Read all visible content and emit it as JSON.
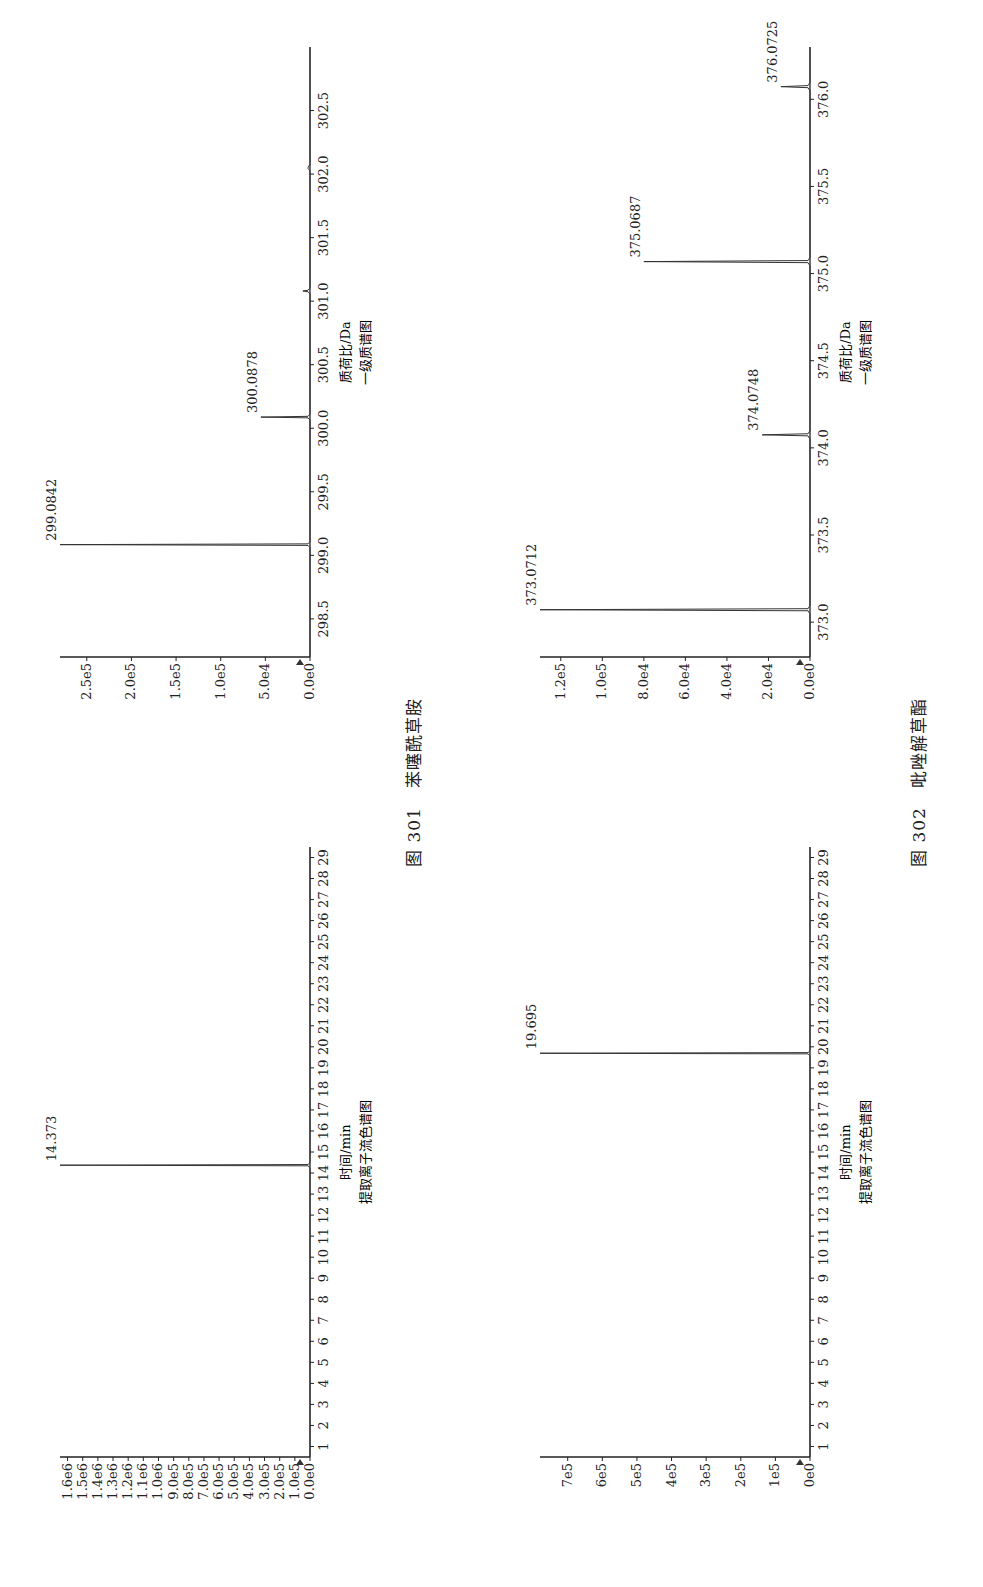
{
  "figures": [
    {
      "caption_num": "图 301",
      "caption_name": "苯噻酰草胺",
      "xic": {
        "xlabel": "时间/min",
        "subtitle": "提取离子流色谱图",
        "yticks": [
          "0.0e0",
          "1.0e5",
          "2.0e5",
          "3.0e5",
          "4.0e5",
          "5.0e5",
          "6.0e5",
          "7.0e5",
          "8.0e5",
          "9.0e5",
          "1.0e6",
          "1.1e6",
          "1.2e6",
          "1.3e6",
          "1.4e6",
          "1.5e6",
          "1.6e6"
        ],
        "peak_label": "14.373"
      },
      "ms": {
        "xlabel": "质荷比/Da",
        "subtitle": "一级质谱图",
        "yticks": [
          "0.0e0",
          "5.0e4",
          "1.0e5",
          "1.5e5",
          "2.0e5",
          "2.5e5"
        ],
        "xticks": [
          "298.5",
          "299.0",
          "299.5",
          "300.0",
          "300.5",
          "301.0",
          "301.5",
          "302.0",
          "302.5"
        ],
        "peak_labels": [
          "299.0842",
          "300.0878"
        ]
      }
    },
    {
      "caption_num": "图 302",
      "caption_name": "吡唑解草酯",
      "xic": {
        "xlabel": "时间/min",
        "subtitle": "提取离子流色谱图",
        "yticks": [
          "0e0",
          "1e5",
          "2e5",
          "3e5",
          "4e5",
          "5e5",
          "6e5",
          "7e5"
        ],
        "peak_label": "19.695"
      },
      "ms": {
        "xlabel": "质荷比/Da",
        "subtitle": "一级质谱图",
        "yticks": [
          "0.0e0",
          "2.0e4",
          "4.0e4",
          "6.0e4",
          "8.0e4",
          "1.0e5",
          "1.2e5"
        ],
        "xticks": [
          "373.0",
          "373.5",
          "374.0",
          "374.5",
          "375.0",
          "375.5",
          "376.0"
        ],
        "peak_labels": [
          "373.0712",
          "374.0748",
          "375.0687",
          "376.0725"
        ]
      }
    }
  ],
  "chart_data": [
    {
      "type": "line",
      "title": "图 301 苯噻酰草胺 — 提取离子流色谱图",
      "xlabel": "时间/min",
      "ylabel": "",
      "x_ticks": [
        1,
        2,
        3,
        4,
        5,
        6,
        7,
        8,
        9,
        10,
        11,
        12,
        13,
        14,
        15,
        16,
        17,
        18,
        19,
        20,
        21,
        22,
        23,
        24,
        25,
        26,
        27,
        28,
        29
      ],
      "xlim": [
        0.5,
        29.5
      ],
      "ylim": [
        0,
        1650000.0
      ],
      "peaks": [
        {
          "x": 14.373,
          "y": 1650000.0,
          "label": "14.373"
        }
      ]
    },
    {
      "type": "line",
      "title": "图 301 苯噻酰草胺 — 一级质谱图",
      "xlabel": "质荷比/Da",
      "ylabel": "",
      "xlim": [
        298.2,
        303.0
      ],
      "ylim": [
        0,
        280000.0
      ],
      "x_ticks": [
        298.5,
        299.0,
        299.5,
        300.0,
        300.5,
        301.0,
        301.5,
        302.0,
        302.5
      ],
      "peaks": [
        {
          "x": 299.0842,
          "y": 280000.0,
          "label": "299.0842"
        },
        {
          "x": 300.0878,
          "y": 55000.0,
          "label": "300.0878"
        },
        {
          "x": 301.08,
          "y": 8000.0,
          "label": ""
        },
        {
          "x": 302.05,
          "y": 2000.0,
          "label": ""
        }
      ]
    },
    {
      "type": "line",
      "title": "图 302 吡唑解草酯 — 提取离子流色谱图",
      "xlabel": "时间/min",
      "ylabel": "",
      "x_ticks": [
        1,
        2,
        3,
        4,
        5,
        6,
        7,
        8,
        9,
        10,
        11,
        12,
        13,
        14,
        15,
        16,
        17,
        18,
        19,
        20,
        21,
        22,
        23,
        24,
        25,
        26,
        27,
        28,
        29
      ],
      "xlim": [
        0.5,
        29.5
      ],
      "ylim": [
        0,
        780000.0
      ],
      "peaks": [
        {
          "x": 19.695,
          "y": 780000.0,
          "label": "19.695"
        }
      ]
    },
    {
      "type": "line",
      "title": "图 302 吡唑解草酯 — 一级质谱图",
      "xlabel": "质荷比/Da",
      "ylabel": "",
      "xlim": [
        372.8,
        376.3
      ],
      "ylim": [
        0,
        130000.0
      ],
      "x_ticks": [
        373.0,
        373.5,
        374.0,
        374.5,
        375.0,
        375.5,
        376.0
      ],
      "peaks": [
        {
          "x": 373.0712,
          "y": 130000.0,
          "label": "373.0712"
        },
        {
          "x": 374.0748,
          "y": 23000.0,
          "label": "374.0748"
        },
        {
          "x": 375.0687,
          "y": 80000.0,
          "label": "375.0687"
        },
        {
          "x": 376.0725,
          "y": 14000.0,
          "label": "376.0725"
        }
      ]
    }
  ]
}
